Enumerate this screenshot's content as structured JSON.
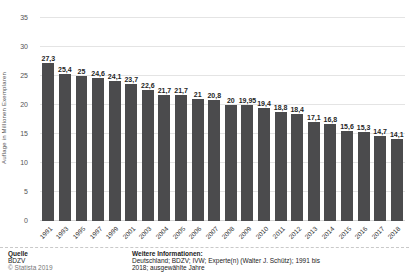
{
  "chart_data": {
    "type": "bar",
    "title": "",
    "xlabel": "",
    "ylabel": "Auflage in Millionen Exemplaren",
    "ylim": [
      0,
      35
    ],
    "yticks": [
      0,
      5,
      10,
      15,
      20,
      25,
      30,
      35
    ],
    "grid": true,
    "legend": false,
    "bar_color": "#4b4b4d",
    "categories": [
      "1991",
      "1993",
      "1995",
      "1997",
      "1999",
      "2001",
      "2003",
      "2004",
      "2005",
      "2006",
      "2007",
      "2008",
      "2009",
      "2010",
      "2011",
      "2012",
      "2013",
      "2014",
      "2015",
      "2016",
      "2017",
      "2018"
    ],
    "values": [
      27.3,
      25.4,
      25,
      24.6,
      24.1,
      23.7,
      22.6,
      21.7,
      21.7,
      21,
      20.8,
      20,
      19.95,
      19.4,
      18.8,
      18.4,
      17.1,
      16.8,
      15.6,
      15.3,
      14.7,
      14.1
    ],
    "value_labels": [
      "27,3",
      "25,4",
      "25",
      "24,6",
      "24,1",
      "23,7",
      "22,6",
      "21,7",
      "21,7",
      "21",
      "20,8",
      "20",
      "19,95",
      "19,4",
      "18,8",
      "18,4",
      "17,1",
      "16,8",
      "15,6",
      "15,3",
      "14,7",
      "14,1"
    ]
  },
  "footer": {
    "source_heading": "Quelle",
    "source": "BDZV",
    "copyright": "© Statista 2019",
    "info_heading": "Weitere Informationen:",
    "info_line1": "Deutschland; BDZV; IVW; Experte(n) (Walter J. Schütz); 1991 bis",
    "info_line2": "2018; ausgewählte Jahre"
  }
}
